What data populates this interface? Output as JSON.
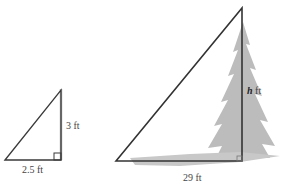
{
  "diagram": {
    "small_triangle": {
      "vertical_label": "3 ft",
      "base_label": "2.5 ft"
    },
    "large_triangle": {
      "height_var": "h",
      "height_unit": "ft",
      "base_label": "29 ft"
    },
    "colors": {
      "line": "#3a3a3a",
      "tree": "#b9b9b9",
      "shadow": "#c4c4c4"
    }
  }
}
